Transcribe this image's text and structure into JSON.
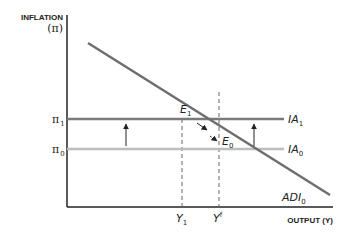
{
  "axes": {
    "y_title": "INFLATION",
    "y_symbol": "(π)",
    "x_title": "OUTPUT (Y)"
  },
  "y_ticks": [
    {
      "symbol": "π",
      "sub": "1"
    },
    {
      "symbol": "π",
      "sub": "0"
    }
  ],
  "x_ticks": [
    {
      "symbol": "Y",
      "sub": "1",
      "sup": ""
    },
    {
      "symbol": "Y",
      "sub": "",
      "sup": "f"
    }
  ],
  "curves": {
    "ia1": {
      "name": "IA",
      "sub": "1",
      "color": "#7a7a7a"
    },
    "ia0": {
      "name": "IA",
      "sub": "0",
      "color": "#bdbdbd"
    },
    "adi0": {
      "name": "ADI",
      "sub": "0",
      "color": "#6e6e6e"
    }
  },
  "points": {
    "e1": {
      "name": "E",
      "sub": "1"
    },
    "e0": {
      "name": "E",
      "sub": "0"
    }
  }
}
